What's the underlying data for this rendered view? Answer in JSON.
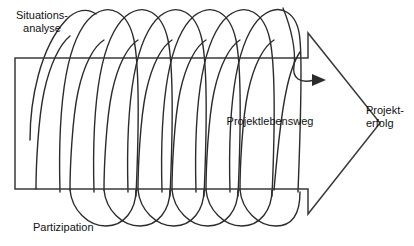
{
  "diagram": {
    "type": "process-arrow-with-helix",
    "title_text": "Projektlebensweg",
    "background_color": "#ffffff",
    "stroke_color": "#2b2b2b",
    "labels": {
      "situationsanalyse_line1": "Situations-",
      "situationsanalyse_line2": "analyse",
      "partizipation": "Partizipation",
      "projektlebensweg": "Projektlebensweg",
      "projekterfolg_line1": "Projekt-",
      "projekterfolg_line2": "erfolg"
    },
    "geometry": {
      "arrow_rect_left": 15,
      "arrow_rect_top": 58,
      "arrow_rect_bottom": 189,
      "arrow_shoulder_x": 308,
      "arrow_shoulder_top": 33,
      "arrow_shoulder_bottom": 214,
      "arrow_tip_x": 380,
      "arrow_tip_y": 123,
      "helix_start_x": 60,
      "helix_end_x": 296,
      "helix_top_y": 8,
      "helix_bottom_y": 226,
      "helix_loops": 7
    }
  }
}
